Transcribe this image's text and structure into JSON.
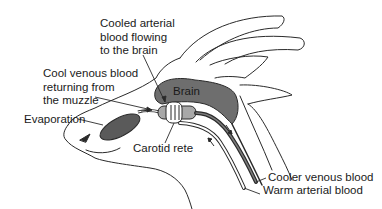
{
  "diagram": {
    "labels": {
      "cooled_arterial": [
        "Cooled arterial",
        "blood flowing",
        "to the brain"
      ],
      "cool_venous": [
        "Cool venous blood",
        "returning from",
        "the muzzle"
      ],
      "evaporation": "Evaporation",
      "brain": "Brain",
      "carotid_rete": "Carotid rete",
      "cooler_venous": "Cooler venous blood",
      "warm_arterial": "Warm arterial blood"
    },
    "colors": {
      "line": "#2a2a2a",
      "brain_fill": "#6e6e6e",
      "rete_fill": "#a8a8a8",
      "nasal_fill": "#5a5a5a",
      "background": "#ffffff"
    }
  }
}
